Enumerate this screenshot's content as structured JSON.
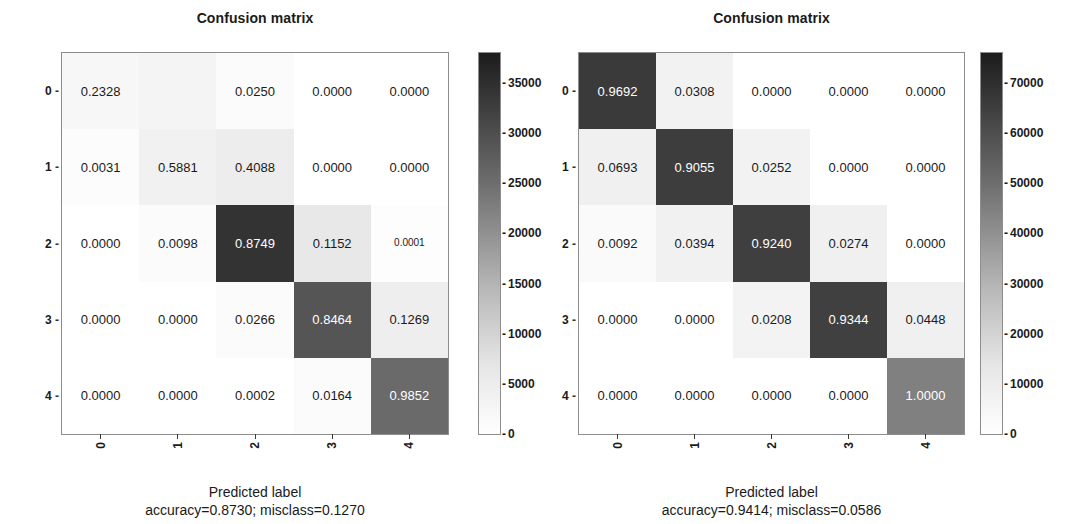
{
  "figure": {
    "background": "#ffffff",
    "cmap_low": "#ffffff",
    "cmap_high": "#1c1c1c"
  },
  "chart_data": [
    {
      "type": "heatmap",
      "id": "left",
      "title": "Confusion matrix",
      "xlabel": "Predicted label",
      "caption": "accuracy=0.8730; misclass=0.1270",
      "accuracy": "0.8730",
      "misclass": "0.1270",
      "grid": false,
      "xticklabels": [
        "0",
        "1",
        "2",
        "3",
        "4"
      ],
      "yticklabels": [
        "0",
        "1",
        "2",
        "3",
        "4"
      ],
      "rows": [
        [
          "0.2328",
          "",
          "0.0250",
          "0.0000",
          "0.0000"
        ],
        [
          "0.0031",
          "0.5881",
          "0.4088",
          "0.0000",
          "0.0000"
        ],
        [
          "0.0000",
          "0.0098",
          "0.8749",
          "0.1152",
          "0.0001"
        ],
        [
          "0.0000",
          "0.0000",
          "0.0266",
          "0.8464",
          "0.1269"
        ],
        [
          "0.0000",
          "0.0000",
          "0.0002",
          "0.0164",
          "0.9852"
        ]
      ],
      "cell_shades": [
        [
          "#f7f7f7",
          "#f4f4f4",
          "#fbfbfb",
          "#ffffff",
          "#ffffff"
        ],
        [
          "#fcfcfc",
          "#f1f1f1",
          "#ededed",
          "#ffffff",
          "#ffffff"
        ],
        [
          "#ffffff",
          "#fbfbfb",
          "#333333",
          "#e8e8e8",
          "#fdfdfd"
        ],
        [
          "#ffffff",
          "#ffffff",
          "#fbfbfb",
          "#555555",
          "#eeeeee"
        ],
        [
          "#ffffff",
          "#ffffff",
          "#ffffff",
          "#fbfbfb",
          "#6a6a6a"
        ]
      ],
      "cell_text_light": [
        [
          false,
          false,
          false,
          false,
          false
        ],
        [
          false,
          false,
          false,
          false,
          false
        ],
        [
          false,
          false,
          true,
          false,
          false
        ],
        [
          false,
          false,
          false,
          true,
          false
        ],
        [
          false,
          false,
          false,
          false,
          true
        ]
      ],
      "cell_text_small": [
        [
          false,
          false,
          false,
          false,
          false
        ],
        [
          false,
          false,
          false,
          false,
          false
        ],
        [
          false,
          false,
          false,
          false,
          true
        ],
        [
          false,
          false,
          false,
          false,
          false
        ],
        [
          false,
          false,
          false,
          false,
          false
        ]
      ],
      "colorbar": {
        "ticks": [
          "35000",
          "30000",
          "25000",
          "20000",
          "15000",
          "10000",
          "5000",
          "0"
        ],
        "vmin": 0,
        "vmax": 38000
      }
    },
    {
      "type": "heatmap",
      "id": "right",
      "title": "Confusion matrix",
      "xlabel": "Predicted label",
      "caption": "accuracy=0.9414; misclass=0.0586",
      "accuracy": "0.9414",
      "misclass": "0.0586",
      "grid": false,
      "xticklabels": [
        "0",
        "1",
        "2",
        "3",
        "4"
      ],
      "yticklabels": [
        "0",
        "1",
        "2",
        "3",
        "4"
      ],
      "rows": [
        [
          "0.9692",
          "0.0308",
          "0.0000",
          "0.0000",
          "0.0000"
        ],
        [
          "0.0693",
          "0.9055",
          "0.0252",
          "0.0000",
          "0.0000"
        ],
        [
          "0.0092",
          "0.0394",
          "0.9240",
          "0.0274",
          "0.0000"
        ],
        [
          "0.0000",
          "0.0000",
          "0.0208",
          "0.9344",
          "0.0448"
        ],
        [
          "0.0000",
          "0.0000",
          "0.0000",
          "0.0000",
          "1.0000"
        ]
      ],
      "cell_shades": [
        [
          "#3a3a3a",
          "#f2f2f2",
          "#ffffff",
          "#ffffff",
          "#ffffff"
        ],
        [
          "#f0f0f0",
          "#3d3d3d",
          "#f2f2f2",
          "#ffffff",
          "#ffffff"
        ],
        [
          "#fafafa",
          "#f1f1f1",
          "#3f3f3f",
          "#f0f0f0",
          "#ffffff"
        ],
        [
          "#ffffff",
          "#ffffff",
          "#f3f3f3",
          "#404040",
          "#f0f0f0"
        ],
        [
          "#ffffff",
          "#ffffff",
          "#ffffff",
          "#ffffff",
          "#808080"
        ]
      ],
      "cell_text_light": [
        [
          true,
          false,
          false,
          false,
          false
        ],
        [
          false,
          true,
          false,
          false,
          false
        ],
        [
          false,
          false,
          true,
          false,
          false
        ],
        [
          false,
          false,
          false,
          true,
          false
        ],
        [
          false,
          false,
          false,
          false,
          true
        ]
      ],
      "cell_text_small": [
        [
          false,
          false,
          false,
          false,
          false
        ],
        [
          false,
          false,
          false,
          false,
          false
        ],
        [
          false,
          false,
          false,
          false,
          false
        ],
        [
          false,
          false,
          false,
          false,
          false
        ],
        [
          false,
          false,
          false,
          false,
          false
        ]
      ],
      "colorbar": {
        "ticks": [
          "70000",
          "60000",
          "50000",
          "40000",
          "30000",
          "20000",
          "10000",
          "0"
        ],
        "vmin": 0,
        "vmax": 76000
      }
    }
  ]
}
